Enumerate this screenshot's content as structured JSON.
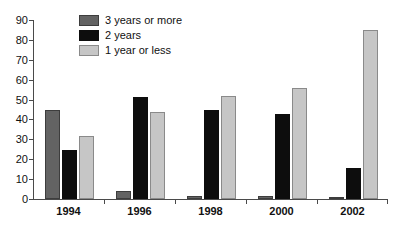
{
  "chart_data": {
    "type": "bar",
    "title": "",
    "subtitle": "",
    "xlabel": "",
    "ylabel": "",
    "categories": [
      "1994",
      "1996",
      "1998",
      "2000",
      "2002"
    ],
    "series": [
      {
        "name": "3 years or more",
        "color": "#636363",
        "values": [
          45,
          4,
          1.5,
          1.5,
          1
        ]
      },
      {
        "name": "2 years",
        "color": "#0d0d0d",
        "values": [
          24.5,
          51.5,
          45,
          42.5,
          15.5
        ]
      },
      {
        "name": "1 year or less",
        "color": "#c6c6c6",
        "values": [
          31.5,
          44,
          52,
          56,
          85
        ]
      }
    ],
    "ylim": [
      0,
      90
    ],
    "ytick_labels": [
      "0",
      "10",
      "20",
      "30",
      "40",
      "50",
      "60",
      "70",
      "80",
      "90"
    ],
    "ytick_values": [
      0,
      10,
      20,
      30,
      40,
      50,
      60,
      70,
      80,
      90
    ],
    "grid": false,
    "legend_position": "top-left-inside",
    "legend_entries": [
      "3 years or more",
      "2 years",
      "1 year or less"
    ]
  }
}
